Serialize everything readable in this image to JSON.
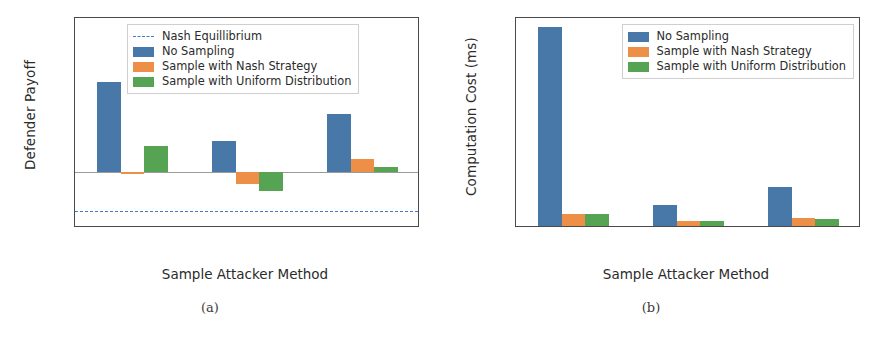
{
  "figure": {
    "panels": [
      {
        "key": "a",
        "subcaption": "(a)",
        "chart_data": {
          "type": "bar",
          "title": "",
          "xlabel": "Sample Attacker Method",
          "ylabel": "Defender Payoff",
          "categories": [
            "No Sampling",
            "Sample Max\nProb",
            "Sample Accu-\nmulated Prob"
          ],
          "yticks": [
            -1,
            0,
            1,
            2,
            3,
            4
          ],
          "yticklabels": [
            "-1",
            "0",
            "1",
            "2",
            "3",
            "4"
          ],
          "ylim": [
            -1.45,
            4.0
          ],
          "grid": false,
          "legend_position": "upper center",
          "series": [
            {
              "name": "No Sampling",
              "color": "#4878a8",
              "values": [
                2.35,
                0.8,
                1.5
              ]
            },
            {
              "name": "Sample with Nash Strategy",
              "color": "#ee8f48",
              "values": [
                -0.02,
                -0.3,
                0.34
              ]
            },
            {
              "name": "Sample with Uniform Distribution",
              "color": "#55a353",
              "values": [
                0.68,
                -0.48,
                0.14
              ]
            }
          ],
          "reference_line": {
            "name": "Nash Equillibrium",
            "value": -1.0,
            "color": "#3f7fc1",
            "style": "dashed"
          },
          "legend": [
            {
              "label": "Nash Equillibrium",
              "type": "dashed-line",
              "color": "#3f7fc1"
            },
            {
              "label": "No Sampling",
              "type": "patch",
              "color": "#4878a8"
            },
            {
              "label": "Sample with Nash Strategy",
              "type": "patch",
              "color": "#ee8f48"
            },
            {
              "label": "Sample with Uniform Distribution",
              "type": "patch",
              "color": "#55a353"
            }
          ]
        }
      },
      {
        "key": "b",
        "subcaption": "(b)",
        "chart_data": {
          "type": "bar",
          "title": "",
          "xlabel": "Sample Attacker Method",
          "ylabel": "Computation Cost (ms)",
          "categories": [
            "No Sampling",
            "Sample Max\nProb",
            "Sample Accu-\nmulated Prob"
          ],
          "yticks": [
            0,
            250,
            500,
            750,
            1000,
            1250,
            1500,
            1750
          ],
          "yticklabels": [
            "0",
            "250",
            "500",
            "750",
            "1000",
            "1250",
            "1500",
            "1750"
          ],
          "ylim": [
            0,
            1800
          ],
          "grid": false,
          "legend_position": "upper right",
          "series": [
            {
              "name": "No Sampling",
              "color": "#4878a8",
              "values": [
                1725,
                195,
                355
              ]
            },
            {
              "name": "Sample with Nash Strategy",
              "color": "#ee8f48",
              "values": [
                118,
                60,
                82
              ]
            },
            {
              "name": "Sample with Uniform Distribution",
              "color": "#55a353",
              "values": [
                118,
                58,
                78
              ]
            }
          ],
          "legend": [
            {
              "label": "No Sampling",
              "type": "patch",
              "color": "#4878a8"
            },
            {
              "label": "Sample with Nash Strategy",
              "type": "patch",
              "color": "#ee8f48"
            },
            {
              "label": "Sample with Uniform Distribution",
              "type": "patch",
              "color": "#55a353"
            }
          ]
        }
      }
    ]
  }
}
